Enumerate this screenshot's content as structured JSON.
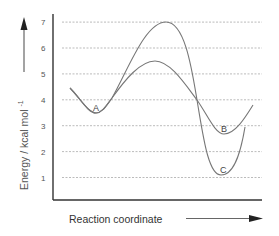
{
  "chart_data": {
    "type": "line",
    "title": "",
    "xlabel": "Reaction coordinate",
    "ylabel": "Energy / kcal mol",
    "ylabel_superscript": "-1",
    "ylim": [
      0,
      7.5
    ],
    "yticks": [
      "1",
      "2",
      "3",
      "4",
      "5",
      "6",
      "7"
    ],
    "grid": "horizontal dashed",
    "legend": "none",
    "series": [
      {
        "name": "Pathway to B (lower barrier)",
        "points": [
          [
            0.08,
            4.45
          ],
          [
            0.2,
            3.5
          ],
          [
            0.27,
            4.0
          ],
          [
            0.48,
            5.5
          ],
          [
            0.69,
            4.0
          ],
          [
            0.82,
            2.7
          ],
          [
            0.96,
            3.8
          ]
        ],
        "min_labels": [
          {
            "label": "A",
            "x": 0.2,
            "y": 3.5
          },
          {
            "label": "B",
            "x": 0.82,
            "y": 2.7
          }
        ]
      },
      {
        "name": "Pathway to C (higher barrier)",
        "points": [
          [
            0.08,
            4.45
          ],
          [
            0.2,
            3.5
          ],
          [
            0.27,
            4.0
          ],
          [
            0.55,
            7.0
          ],
          [
            0.69,
            4.0
          ],
          [
            0.81,
            1.1
          ],
          [
            0.92,
            3.0
          ]
        ],
        "min_labels": [
          {
            "label": "A",
            "x": 0.2,
            "y": 3.5
          },
          {
            "label": "C",
            "x": 0.81,
            "y": 1.1
          }
        ]
      }
    ],
    "annotations": [
      "A",
      "B",
      "C"
    ],
    "colors": {
      "curve": "#777777",
      "grid": "#aaaaaa",
      "axis": "#333333"
    }
  },
  "labels": {
    "point_a": "A",
    "point_b": "B",
    "point_c": "C"
  }
}
